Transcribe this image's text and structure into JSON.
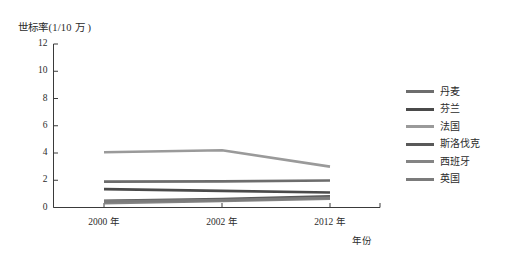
{
  "chart_data": {
    "type": "line",
    "title": "",
    "ylabel": "世标率(1/10 万 )",
    "xlabel": "年份",
    "categories": [
      "2000 年",
      "2002 年",
      "2012 年"
    ],
    "x_values": [
      2000,
      2002,
      2012
    ],
    "ylim": [
      0,
      12
    ],
    "y_ticks": [
      "0",
      "2",
      "4",
      "6",
      "8",
      "10",
      "12"
    ],
    "grid": false,
    "legend_position": "right",
    "series": [
      {
        "name": "丹麦",
        "values": [
          1.9,
          1.92,
          1.98
        ],
        "color": "#6d6d6d"
      },
      {
        "name": "芬兰",
        "values": [
          1.35,
          1.22,
          1.1
        ],
        "color": "#4a4a4a"
      },
      {
        "name": "法国",
        "values": [
          4.05,
          4.2,
          3.0
        ],
        "color": "#9a9a9a"
      },
      {
        "name": "斯洛伐克",
        "values": [
          0.5,
          0.62,
          0.82
        ],
        "color": "#595959"
      },
      {
        "name": "西班牙",
        "values": [
          0.32,
          0.48,
          0.64
        ],
        "color": "#848484"
      },
      {
        "name": "英国",
        "values": [
          0.45,
          0.55,
          0.72
        ],
        "color": "#7b7b7b"
      }
    ]
  },
  "axes": {
    "y_title": "世标率(1/10 万 )",
    "x_title": "年份",
    "y_tick_labels": [
      "12",
      "10",
      "8",
      "6",
      "4",
      "2",
      "0"
    ],
    "x_tick_labels": [
      "2000 年",
      "2002 年",
      "2012 年"
    ]
  },
  "legend": {
    "items": [
      {
        "label": "丹麦"
      },
      {
        "label": "芬兰"
      },
      {
        "label": "法国"
      },
      {
        "label": "斯洛伐克"
      },
      {
        "label": "西班牙"
      },
      {
        "label": "英国"
      }
    ]
  },
  "style": {
    "axis_color": "#3a3a3a",
    "text_color": "#2b2b2b",
    "background": "#ffffff"
  }
}
